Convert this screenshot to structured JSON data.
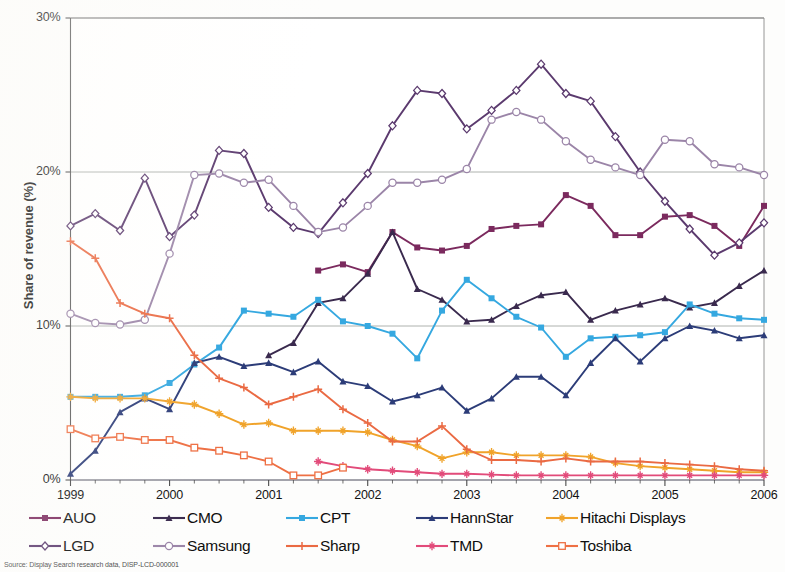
{
  "axes": {
    "ylabel": "Share of revenue (%)",
    "yticks": [
      "0%",
      "10%",
      "20%",
      "30%"
    ],
    "yvalues": [
      0,
      10,
      20,
      30
    ],
    "xticks": [
      "1999",
      "2000",
      "2001",
      "2002",
      "2003",
      "2004",
      "2005",
      "2006"
    ],
    "xvalues": [
      1999,
      2000,
      2001,
      2002,
      2003,
      2004,
      2005,
      2006
    ]
  },
  "footnote": "Source: Display Search research data, DISP-LCD-000001",
  "legend": {
    "row1": [
      {
        "label": "AUO",
        "color": "#7b2a5e",
        "marker": "square"
      },
      {
        "label": "CMO",
        "color": "#3a2a4e",
        "marker": "triangle"
      },
      {
        "label": "CPT",
        "color": "#35a8e0",
        "marker": "square"
      },
      {
        "label": "HannStar",
        "color": "#2c3c78",
        "marker": "triangle"
      },
      {
        "label": "Hitachi Displays",
        "color": "#f0a32a",
        "marker": "star"
      }
    ],
    "row2": [
      {
        "label": "LGD",
        "color": "#5b3a6e",
        "marker": "diamond"
      },
      {
        "label": "Samsung",
        "color": "#9b85a8",
        "marker": "circle"
      },
      {
        "label": "Sharp",
        "color": "#ea6a43",
        "marker": "plus"
      },
      {
        "label": "TMD",
        "color": "#e24b7a",
        "marker": "star"
      },
      {
        "label": "Toshiba",
        "color": "#ee7044",
        "marker": "opensquare"
      }
    ]
  },
  "chart_data": {
    "type": "line",
    "title": "",
    "xlabel": "",
    "ylabel": "Share of revenue (%)",
    "xlim": [
      1999,
      2006.0
    ],
    "ylim": [
      0,
      30
    ],
    "grid": "horizontal",
    "legend_position": "bottom",
    "x": [
      1999,
      1999.25,
      1999.5,
      1999.75,
      2000,
      2000.25,
      2000.5,
      2000.75,
      2001,
      2001.25,
      2001.5,
      2001.75,
      2002,
      2002.25,
      2002.5,
      2002.75,
      2003,
      2003.25,
      2003.5,
      2003.75,
      2004,
      2004.25,
      2004.5,
      2004.75,
      2005,
      2005.25,
      2005.5,
      2005.75,
      2006
    ],
    "series": [
      {
        "name": "AUO",
        "color": "#7b2a5e",
        "marker": "square",
        "start_index": 10,
        "values": [
          null,
          null,
          null,
          null,
          null,
          null,
          null,
          null,
          null,
          null,
          13.6,
          14.0,
          13.5,
          16.1,
          15.1,
          14.9,
          15.2,
          16.3,
          16.5,
          16.6,
          18.5,
          17.8,
          15.9,
          15.9,
          17.1,
          17.2,
          16.5,
          15.2,
          17.8
        ]
      },
      {
        "name": "CMO",
        "color": "#3a2a4e",
        "marker": "triangle",
        "start_index": 8,
        "values": [
          null,
          null,
          null,
          null,
          null,
          null,
          null,
          null,
          8.1,
          8.9,
          11.5,
          11.8,
          13.4,
          16.1,
          12.4,
          11.7,
          10.3,
          10.4,
          11.3,
          12.0,
          12.2,
          10.4,
          11.0,
          11.4,
          11.8,
          11.2,
          11.5,
          12.6,
          13.6
        ]
      },
      {
        "name": "CPT",
        "color": "#35a8e0",
        "marker": "square",
        "start_index": 0,
        "values": [
          5.4,
          5.4,
          5.4,
          5.5,
          6.3,
          7.5,
          8.6,
          11.0,
          10.8,
          10.6,
          11.7,
          10.3,
          10.0,
          9.5,
          7.9,
          11.0,
          13.0,
          11.8,
          10.6,
          9.9,
          8.0,
          9.2,
          9.3,
          9.4,
          9.6,
          11.4,
          10.8,
          10.5,
          10.4
        ]
      },
      {
        "name": "HannStar",
        "color": "#2c3c78",
        "marker": "triangle",
        "start_index": 0,
        "values": [
          0.4,
          1.9,
          4.4,
          5.3,
          4.6,
          7.6,
          8.0,
          7.4,
          7.6,
          7.0,
          7.7,
          6.4,
          6.1,
          5.1,
          5.5,
          6.0,
          4.5,
          5.3,
          6.7,
          6.7,
          5.5,
          7.6,
          9.2,
          7.7,
          9.2,
          10.0,
          9.7,
          9.2,
          9.4
        ]
      },
      {
        "name": "Hitachi Displays",
        "color": "#f0a32a",
        "marker": "star",
        "start_index": 0,
        "values": [
          5.4,
          5.3,
          5.3,
          5.3,
          5.1,
          4.9,
          4.3,
          3.6,
          3.7,
          3.2,
          3.2,
          3.2,
          3.1,
          2.6,
          2.2,
          1.4,
          1.8,
          1.8,
          1.6,
          1.6,
          1.6,
          1.5,
          1.1,
          0.9,
          0.8,
          0.7,
          0.6,
          0.5,
          0.5
        ]
      },
      {
        "name": "LGD",
        "color": "#5b3a6e",
        "marker": "diamond",
        "start_index": 0,
        "values": [
          16.5,
          17.3,
          16.2,
          19.6,
          15.8,
          17.2,
          21.4,
          21.2,
          17.7,
          16.4,
          16.0,
          18.0,
          19.9,
          23.0,
          25.3,
          25.1,
          22.8,
          24.0,
          25.3,
          27.0,
          25.1,
          24.6,
          22.3,
          20.0,
          18.1,
          16.3,
          14.6,
          15.4,
          16.7
        ]
      },
      {
        "name": "Samsung",
        "color": "#9b85a8",
        "marker": "circle",
        "start_index": 0,
        "values": [
          10.8,
          10.2,
          10.1,
          10.4,
          14.7,
          19.8,
          19.9,
          19.3,
          19.5,
          17.8,
          16.1,
          16.4,
          17.8,
          19.3,
          19.3,
          19.5,
          20.2,
          23.4,
          23.9,
          23.4,
          22.0,
          20.8,
          20.3,
          19.8,
          22.1,
          22.0,
          20.5,
          20.3,
          19.8
        ]
      },
      {
        "name": "Sharp",
        "color": "#ea6a43",
        "marker": "plus",
        "start_index": 0,
        "values": [
          15.5,
          14.4,
          11.5,
          10.8,
          10.5,
          8.1,
          6.6,
          6.0,
          4.9,
          5.4,
          5.9,
          4.6,
          3.7,
          2.5,
          2.5,
          3.5,
          2.0,
          1.3,
          1.3,
          1.2,
          1.4,
          1.2,
          1.2,
          1.2,
          1.1,
          1.0,
          0.9,
          0.7,
          0.6
        ]
      },
      {
        "name": "TMD",
        "color": "#e24b7a",
        "marker": "star",
        "start_index": 10,
        "values": [
          null,
          null,
          null,
          null,
          null,
          null,
          null,
          null,
          null,
          null,
          1.2,
          0.9,
          0.7,
          0.6,
          0.5,
          0.4,
          0.4,
          0.35,
          0.3,
          0.3,
          0.3,
          0.3,
          0.3,
          0.3,
          0.3,
          0.3,
          0.3,
          0.3,
          0.3
        ]
      },
      {
        "name": "Toshiba",
        "color": "#ee7044",
        "marker": "opensquare",
        "start_index": 0,
        "end_index": 11,
        "values": [
          3.3,
          2.7,
          2.8,
          2.6,
          2.6,
          2.1,
          1.9,
          1.6,
          1.2,
          0.3,
          0.3,
          0.8,
          null,
          null,
          null,
          null,
          null,
          null,
          null,
          null,
          null,
          null,
          null,
          null,
          null,
          null,
          null,
          null,
          null
        ]
      }
    ]
  }
}
